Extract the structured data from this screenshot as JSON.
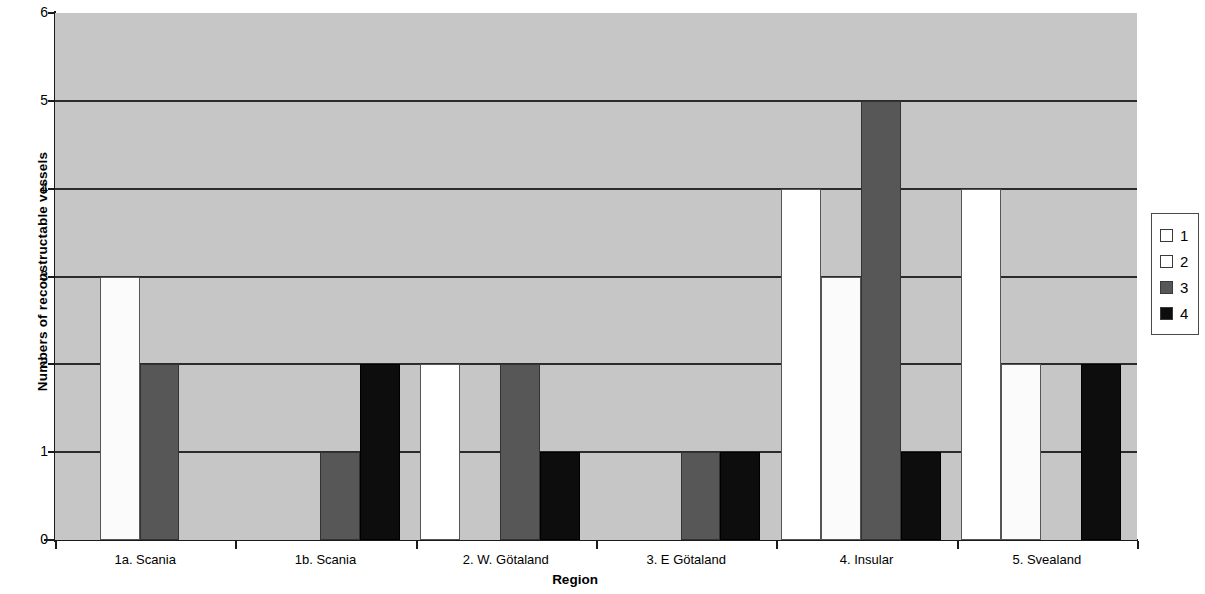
{
  "chart_data": {
    "type": "bar",
    "title": "",
    "xlabel": "Region",
    "ylabel": "Numbers of reconstructable vessels",
    "categories": [
      "1a. Scania",
      "1b. Scania",
      "2. W. Götaland",
      "3. E Götaland",
      "4. Insular",
      "5. Svealand"
    ],
    "series": [
      {
        "name": "1",
        "color": "#ffffff",
        "values": [
          0,
          0,
          2,
          0,
          4,
          4
        ]
      },
      {
        "name": "2",
        "color": "#ffffff",
        "values": [
          3,
          0,
          0,
          0,
          3,
          2
        ]
      },
      {
        "name": "3",
        "color": "#575757",
        "values": [
          2,
          1,
          2,
          1,
          5,
          0
        ]
      },
      {
        "name": "4",
        "color": "#0d0d0d",
        "values": [
          0,
          2,
          1,
          1,
          1,
          2
        ]
      }
    ],
    "ylim": [
      0,
      6
    ],
    "yticks": [
      0,
      1,
      2,
      3,
      4,
      5,
      6
    ],
    "ytick_labels": [
      "0",
      "1",
      "2",
      "3",
      "4",
      "5",
      "6"
    ],
    "grid": true,
    "legend_position": "right",
    "plot_background": "#c6c6c6"
  },
  "legend": {
    "entries": [
      {
        "label": "1"
      },
      {
        "label": "2"
      },
      {
        "label": "3"
      },
      {
        "label": "4"
      }
    ]
  }
}
